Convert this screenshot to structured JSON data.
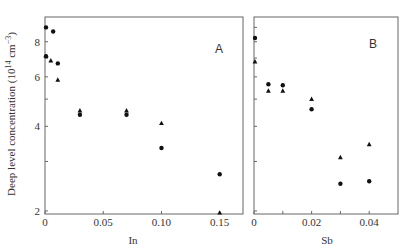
{
  "chart_data": [
    {
      "type": "scatter",
      "panel_label": "A",
      "title": "",
      "xlabel": "In",
      "ylabel": "Deep level concentration (10^14 cm^-3)",
      "xlim": [
        0,
        0.17
      ],
      "ylim": [
        1.95,
        9.8
      ],
      "yscale": "log",
      "xticks": [
        0,
        0.05,
        0.1,
        0.15
      ],
      "xtick_labels": [
        "0",
        "0.05",
        "0.10",
        "0.15"
      ],
      "yticks": [
        2,
        4,
        6,
        8
      ],
      "ytick_labels": [
        "2",
        "4",
        "6",
        "8"
      ],
      "yminor_ticks": [
        3,
        5,
        7,
        9
      ],
      "grid": false,
      "series": [
        {
          "name": "circle",
          "marker": "circle",
          "x": [
            0,
            0.007,
            0,
            0.011,
            0.03,
            0.07,
            0.1,
            0.15
          ],
          "y": [
            9.0,
            8.7,
            7.1,
            6.7,
            4.4,
            4.4,
            3.35,
            2.7
          ]
        },
        {
          "name": "triangle",
          "marker": "triangle",
          "x": [
            0,
            0.005,
            0.011,
            0.03,
            0.07,
            0.1,
            0.15
          ],
          "y": [
            7.1,
            6.85,
            5.85,
            4.55,
            4.55,
            4.1,
            1.97
          ]
        }
      ]
    },
    {
      "type": "scatter",
      "panel_label": "B",
      "title": "",
      "xlabel": "Sb",
      "ylabel": "",
      "xlim": [
        0,
        0.05
      ],
      "ylim": [
        1.95,
        9.8
      ],
      "yscale": "log",
      "xticks": [
        0,
        0.01,
        0.02,
        0.03,
        0.04
      ],
      "xtick_labels": [
        "0",
        "",
        "0.02",
        "",
        "0.04"
      ],
      "grid": false,
      "series": [
        {
          "name": "circle",
          "marker": "circle",
          "x": [
            0,
            0.005,
            0.01,
            0.02,
            0.03,
            0.04
          ],
          "y": [
            8.25,
            5.65,
            5.6,
            4.6,
            2.5,
            2.55
          ]
        },
        {
          "name": "triangle",
          "marker": "triangle",
          "x": [
            0,
            0.005,
            0.01,
            0.02,
            0.03,
            0.04
          ],
          "y": [
            6.8,
            5.35,
            5.35,
            5.0,
            3.1,
            3.45
          ]
        }
      ]
    }
  ],
  "labels": {
    "ylabel": "Deep level concentration (10",
    "ylabel_sup1": "14",
    "ylabel_mid": " cm",
    "ylabel_sup2": "−3",
    "ylabel_end": ")",
    "panel_a": "A",
    "panel_b": "B",
    "xlabel_a": "In",
    "xlabel_b": "Sb"
  }
}
